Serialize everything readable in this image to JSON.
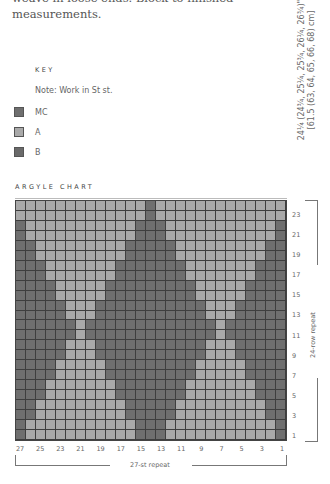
{
  "intro": {
    "line1": "weave in loose ends. Block to finished",
    "line2": "measurements."
  },
  "measurement": {
    "line1": "24¼ (24¾, 25¼, 25¾, 26¼, 26¾)\"",
    "line2": "[61.5 (63, 64, 65, 66, 68) cm]"
  },
  "key": {
    "title": "KEY",
    "note": "Note: Work in St st.",
    "items": [
      {
        "label": "MC",
        "color": "#6f6f6f"
      },
      {
        "label": "A",
        "color": "#a9a9a9"
      },
      {
        "label": "B",
        "color": "#6a6a6a"
      }
    ]
  },
  "chart": {
    "title": "ARGYLE CHART",
    "row_labels": [
      "23",
      "21",
      "19",
      "17",
      "15",
      "13",
      "11",
      "9",
      "7",
      "5",
      "3",
      "1"
    ],
    "col_labels": [
      "27",
      "25",
      "23",
      "21",
      "19",
      "17",
      "15",
      "13",
      "11",
      "9",
      "7",
      "5",
      "3",
      "1"
    ],
    "stitch_repeat": "27-st repeat",
    "row_repeat": "24-row repeat"
  },
  "chart_data": {
    "type": "table",
    "title": "ARGYLE CHART",
    "columns": 27,
    "rows": 24,
    "legend": {
      "M": "MC",
      "A": "A",
      "B": "B"
    },
    "colors": {
      "M": "#6f6f6f",
      "A": "#a9a9a9",
      "B": "#6a6a6a"
    },
    "grid_top_to_bottom": [
      "AAAAAAAAAAAAAMAAAAAAAAAAAAA",
      "AAAAAAAAAAAAAMAAAAAAAAAAAAA",
      "MAAAAAAAAAAAMMMAAAAAAAAAAAM",
      "MAAAAAAAAAAAMMMAAAAAAAAAAAM",
      "MMAAAAAAAAAMMMMMAAAAAAAAAMM",
      "MMAAAAAAAAAMMMMMAAAAAAAAAMM",
      "MMMAAAAAAAMMMMMMMAAAAAAAMMM",
      "MMMAAAAAAAMMMMMMMAAAAAAAMMM",
      "MMMMAAAAAMMMMMMMMMAAAAAMMMM",
      "MMMMAAAAAMMMMMMMMMAAAAAMMMM",
      "MMMMMAAAMMMMMMMMMMMAAAMMMMM",
      "MMMMMAAAMMMMMMMMMMMAAAMMMMM",
      "MMMMMMAMMMMMMMMMMMMMAMMMMMM",
      "MMMMMMAMMMMMMMMMMMMMAMMMMMM",
      "MMMMMAAAMMMMMMMMMMMAAAMMMMM",
      "MMMMMAAAMMMMMMMMMMMAAAMMMMM",
      "MMMMAAAAAMMMMMMMMMAAAAAMMMM",
      "MMMMAAAAAMMMMMMMMMAAAAAMMMM",
      "MMMAAAAAAAMMMMMMMAAAAAAAMMM",
      "MMMAAAAAAAMMMMMMMAAAAAAAMMM",
      "MMAAAAAAAAAMMMMMAAAAAAAAAMM",
      "MMAAAAAAAAAMMMMMAAAAAAAAAMM",
      "MAAAAAAAAAAAMMMAAAAAAAAAAAM",
      "MAAAAAAAAAAAMMMAAAAAAAAAAAM"
    ],
    "xlabel": "27-st repeat",
    "ylabel": "24-row repeat"
  }
}
